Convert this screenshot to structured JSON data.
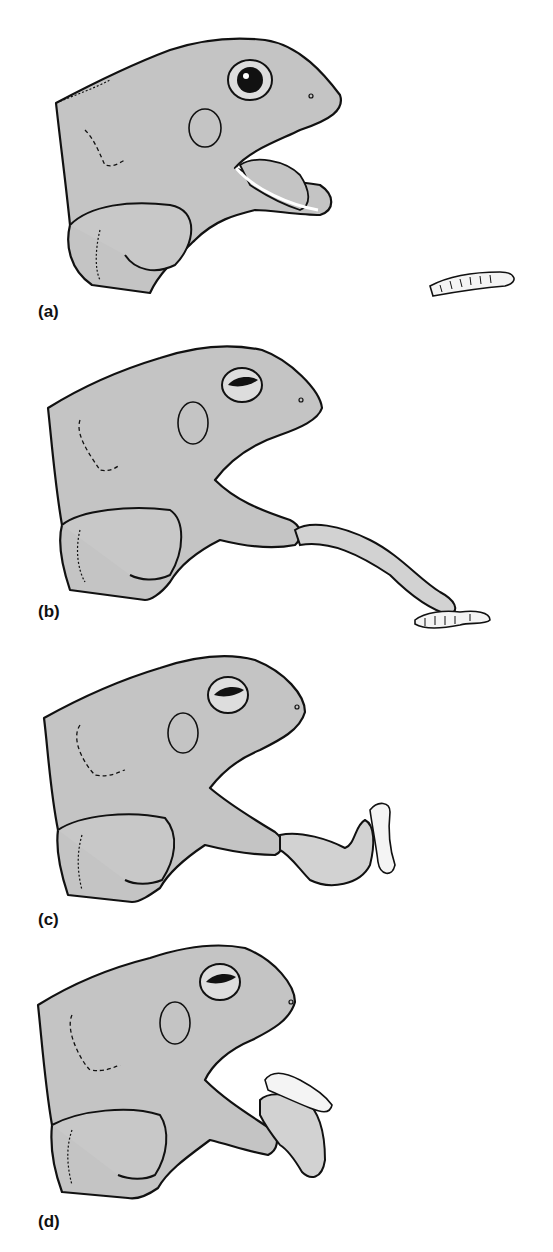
{
  "figure": {
    "colors": {
      "skin": "#c4c4c4",
      "skin_light": "#d2d2d2",
      "outline": "#111111",
      "worm": "#f4f4f4",
      "background": "#ffffff"
    },
    "panels": [
      {
        "label": "(a)",
        "stage": "mouth opening, tongue beginning to flip forward"
      },
      {
        "label": "(b)",
        "stage": "tongue fully extended, tip touching worm"
      },
      {
        "label": "(c)",
        "stage": "tongue retracting with worm attached"
      },
      {
        "label": "(d)",
        "stage": "worm drawn toward mouth"
      }
    ]
  }
}
